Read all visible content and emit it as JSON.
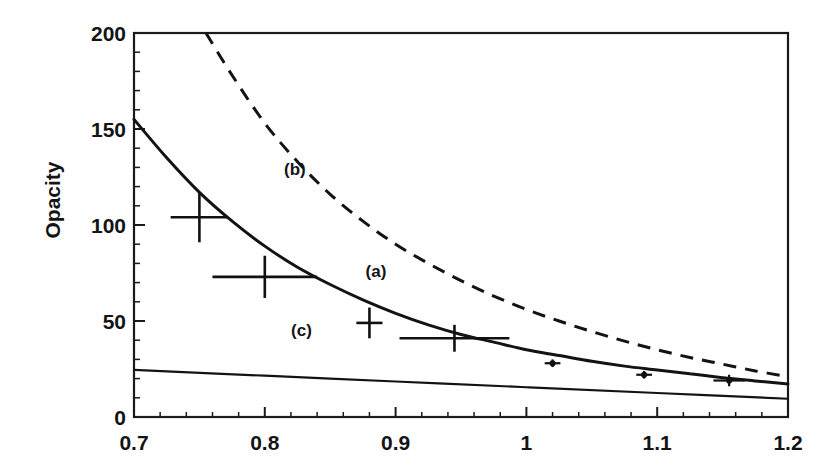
{
  "chart_data": {
    "type": "line",
    "title": "",
    "xlabel": "",
    "ylabel": "Opacity",
    "xlim": [
      0.7,
      1.2
    ],
    "ylim": [
      0,
      200
    ],
    "x_ticks": [
      "0.7",
      "0.8",
      "0.9",
      "1",
      "1.1",
      "1.2"
    ],
    "x_tick_values": [
      0.7,
      0.8,
      0.9,
      1.0,
      1.1,
      1.2
    ],
    "y_ticks": [
      "0",
      "50",
      "100",
      "150",
      "200"
    ],
    "y_tick_values": [
      0,
      50,
      100,
      150,
      200
    ],
    "x_minor_step": 0.02,
    "y_minor_step": 10,
    "grid": false,
    "legend_position": "inline-annotations",
    "series": [
      {
        "name": "(a)",
        "style": "solid",
        "label": "(a)",
        "label_x": 0.885,
        "label_y": 76,
        "x": [
          0.7,
          0.725,
          0.75,
          0.775,
          0.8,
          0.825,
          0.85,
          0.875,
          0.9,
          0.925,
          0.95,
          0.975,
          1.0,
          1.025,
          1.05,
          1.075,
          1.1,
          1.125,
          1.15,
          1.175,
          1.2
        ],
        "values": [
          155,
          135,
          117,
          102,
          89,
          78,
          69,
          61,
          54,
          48,
          43,
          39,
          35,
          32,
          29,
          26.5,
          24.5,
          22.5,
          20.5,
          18.8,
          17.2
        ]
      },
      {
        "name": "(b)",
        "style": "dashed",
        "label": "(b)",
        "label_x": 0.823,
        "label_y": 129,
        "x": [
          0.755,
          0.775,
          0.8,
          0.825,
          0.85,
          0.875,
          0.9,
          0.925,
          0.95,
          0.975,
          1.0,
          1.025,
          1.05,
          1.075,
          1.1,
          1.125,
          1.15,
          1.175,
          1.2
        ],
        "values": [
          200,
          178,
          153,
          133,
          116,
          102,
          90,
          80,
          71,
          63,
          56,
          50,
          44.5,
          39.5,
          35,
          31,
          27.5,
          24,
          21
        ]
      },
      {
        "name": "(c)",
        "style": "solid-thin",
        "label": "(c)",
        "label_x": 0.828,
        "label_y": 45,
        "x": [
          0.7,
          0.8,
          0.9,
          1.0,
          1.1,
          1.2
        ],
        "values": [
          24.5,
          21.5,
          18.5,
          15.5,
          12.5,
          9.5
        ]
      }
    ],
    "data_points": [
      {
        "x": 0.75,
        "y": 104,
        "x_err": 0.022,
        "y_err": 13,
        "marker": "cross"
      },
      {
        "x": 0.8,
        "y": 73,
        "x_err": 0.04,
        "y_err": 11,
        "marker": "cross"
      },
      {
        "x": 0.88,
        "y": 49,
        "x_err": 0.01,
        "y_err": 8,
        "marker": "cross"
      },
      {
        "x": 0.945,
        "y": 41,
        "x_err": 0.042,
        "y_err": 7,
        "marker": "cross"
      },
      {
        "x": 1.02,
        "y": 28,
        "x_err": 0.006,
        "y_err": 2,
        "marker": "dot"
      },
      {
        "x": 1.09,
        "y": 22,
        "x_err": 0.006,
        "y_err": 2,
        "marker": "dot"
      },
      {
        "x": 1.155,
        "y": 19,
        "x_err": 0.012,
        "y_err": 3,
        "marker": "dot"
      }
    ]
  }
}
